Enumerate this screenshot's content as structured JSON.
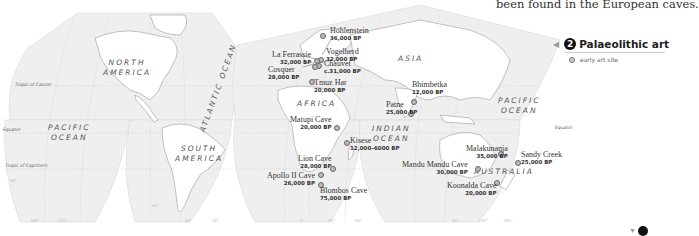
{
  "caption_top": "been found in the European caves.",
  "legend": {
    "number": "2",
    "title": "Palaeolithic art",
    "items": [
      {
        "symbol": "dot",
        "label": "early art site"
      }
    ]
  },
  "regions": {
    "north_america": [
      "NORTH",
      "AMERICA"
    ],
    "south_america": [
      "SOUTH",
      "AMERICA"
    ],
    "africa": "AFRICA",
    "asia": "ASIA",
    "australia": "AUSTRALIA",
    "pacific_ocean_west": [
      "PACIFIC",
      "OCEAN"
    ],
    "pacific_ocean_east": [
      "PACIFIC",
      "OCEAN"
    ],
    "indian_ocean": [
      "INDIAN",
      "OCEAN"
    ],
    "atlantic_ocean": "ATLANTIC OCEAN"
  },
  "lines": {
    "tropic_cancer": "Tropic of Cancer",
    "equator_west": "Equator",
    "equator_east": "Equator",
    "tropic_capricorn": "Tropic of Capricorn"
  },
  "degrees": [
    "30°",
    "180°",
    "120°",
    "90°",
    "60°",
    "30°",
    "0°",
    "30°",
    "60°",
    "90°",
    "120°",
    "150°"
  ],
  "sites": [
    {
      "name": "Hohlenstein",
      "date": "36,000 BP"
    },
    {
      "name": "Vogelherd",
      "date": "32,000 BP"
    },
    {
      "name": "La Ferrassie",
      "date": "32,000 BP"
    },
    {
      "name": "Chauvet",
      "date": "c.31,000 BP"
    },
    {
      "name": "Cosquer",
      "date": "28,000 BP"
    },
    {
      "name": "Tmuz Har",
      "date": "20,000 BP"
    },
    {
      "name": "Matupi Cave",
      "date": "20,000 BP"
    },
    {
      "name": "Kisese",
      "date": "12,000–6000 BP"
    },
    {
      "name": "Lion Cave",
      "date": "28,000 BP"
    },
    {
      "name": "Apollo II Cave",
      "date": "26,000 BP"
    },
    {
      "name": "Blombos Cave",
      "date": "75,000 BP"
    },
    {
      "name": "Bhimbetka",
      "date": "12,000 BP"
    },
    {
      "name": "Patne",
      "date": "25,000 BP"
    },
    {
      "name": "Malakunanja",
      "date": "35,000 BP"
    },
    {
      "name": "Sandy Creek",
      "date": "25,000 BP"
    },
    {
      "name": "Mandu Mandu Cave",
      "date": "30,000 BP"
    },
    {
      "name": "Koonalda Cave",
      "date": "20,000 BP"
    }
  ]
}
